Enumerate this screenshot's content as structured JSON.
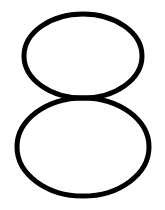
{
  "figure": {
    "glyph": "8",
    "background_color": "#ffffff",
    "stroke_color": "#000000",
    "stroke_width": 5,
    "shapes": [
      {
        "name": "top-loop",
        "cx": 83,
        "cy": 56,
        "rx": 59,
        "ry": 42
      },
      {
        "name": "bottom-loop",
        "cx": 83,
        "cy": 147,
        "rx": 66,
        "ry": 49
      }
    ]
  }
}
